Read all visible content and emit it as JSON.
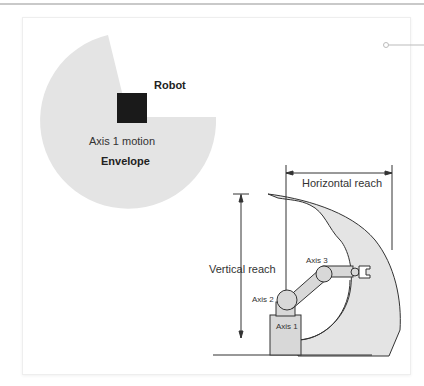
{
  "figure": {
    "top_view": {
      "robot_label": "Robot",
      "motion_label": "Axis 1 motion",
      "envelope_label": "Envelope"
    },
    "side_view": {
      "horizontal_reach_label": "Horizontal reach",
      "vertical_reach_label": "Vertical reach",
      "axis1_label": "Axis 1",
      "axis2_label": "Axis 2",
      "axis3_label": "Axis 3"
    },
    "colors": {
      "envelope_fill": "#e4e4e4",
      "robot_block": "#1a1a1a",
      "arm_fill": "#d8d8d8",
      "line": "#333333"
    }
  }
}
